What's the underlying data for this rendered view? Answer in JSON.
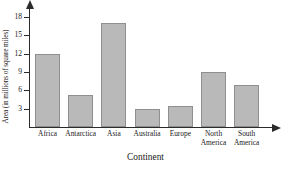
{
  "chart_data": {
    "type": "bar",
    "title": "",
    "xlabel": "Continent",
    "ylabel": "Area (in millions of square miles)",
    "categories": [
      "Africa",
      "Antarctica",
      "Asia",
      "Australia",
      "Europe",
      "North\nAmerica",
      "South\nAmerica"
    ],
    "values": [
      12.0,
      5.3,
      17.0,
      3.0,
      3.4,
      9.0,
      6.9
    ],
    "ylim": [
      0,
      19.5
    ],
    "yticks": [
      3,
      6,
      9,
      12,
      15,
      18
    ],
    "ytick_labels": [
      "3",
      "6",
      "9",
      "12",
      "15",
      "18"
    ],
    "grid": false,
    "legend": false,
    "bar_color": "#b9b9b9",
    "bar_border_color": "#8f8f8f",
    "axis_color": "#2b2b2b",
    "text_color": "#1a1a1a"
  }
}
